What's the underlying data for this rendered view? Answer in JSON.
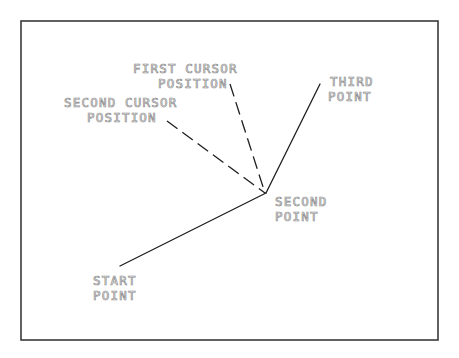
{
  "diagram": {
    "title": "",
    "frame": {
      "x": 21,
      "y": 21,
      "width": 417,
      "height": 319,
      "color": "#3a3a3a"
    },
    "points": {
      "start": {
        "x": 120,
        "y": 266
      },
      "second": {
        "x": 266,
        "y": 193
      },
      "third": {
        "x": 320,
        "y": 84
      },
      "first_cursor": {
        "x": 230,
        "y": 84
      },
      "second_cursor": {
        "x": 167,
        "y": 121
      }
    },
    "segments": [
      {
        "id": "start-to-second",
        "style": "solid",
        "from": "start",
        "to": "second"
      },
      {
        "id": "second-to-third",
        "style": "solid",
        "from": "second",
        "to": "third"
      },
      {
        "id": "second-to-first-cursor",
        "style": "dashed",
        "from": "second",
        "to": "first_cursor"
      },
      {
        "id": "second-to-second-cursor",
        "style": "dashed",
        "from": "second",
        "to": "second_cursor"
      }
    ],
    "labels": {
      "first_cursor": {
        "line1": "FIRST CURSOR",
        "line2": "POSITION"
      },
      "second_cursor": {
        "line1": "SECOND CURSOR",
        "line2": "POSITION"
      },
      "third_point": {
        "line1": "THIRD",
        "line2": "POINT"
      },
      "second_point": {
        "line1": "SECOND",
        "line2": "POINT"
      },
      "start_point": {
        "line1": "START",
        "line2": "POINT"
      }
    },
    "colors": {
      "line": "#1e1e1e",
      "label": "#8a8a8a",
      "background": "#ffffff"
    }
  }
}
